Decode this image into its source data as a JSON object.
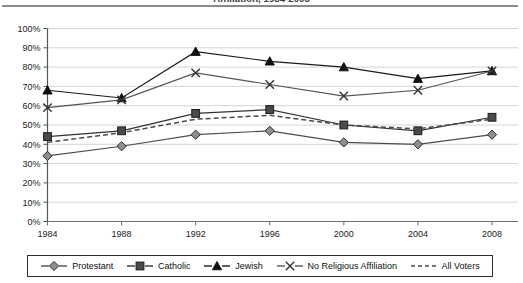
{
  "chart_data": {
    "type": "line",
    "title": "Affiliation, 1984-2008",
    "xlabel": "",
    "ylabel": "",
    "x": [
      1984,
      1988,
      1992,
      1996,
      2000,
      2004,
      2008
    ],
    "categories": [
      "1984",
      "1988",
      "1992",
      "1996",
      "2000",
      "2004",
      "2008"
    ],
    "ylim": [
      0,
      100
    ],
    "ytick_labels": [
      "0%",
      "10%",
      "20%",
      "30%",
      "40%",
      "50%",
      "60%",
      "70%",
      "80%",
      "90%",
      "100%"
    ],
    "ytick_values": [
      0,
      10,
      20,
      30,
      40,
      50,
      60,
      70,
      80,
      90,
      100
    ],
    "grid": "horizontal",
    "legend_position": "bottom",
    "series": [
      {
        "name": "Protestant",
        "marker": "diamond",
        "linestyle": "solid",
        "color": "#4d4d4d",
        "values": [
          34,
          39,
          45,
          47,
          41,
          40,
          45
        ]
      },
      {
        "name": "Catholic",
        "marker": "square",
        "linestyle": "solid",
        "color": "#333333",
        "values": [
          44,
          47,
          56,
          58,
          50,
          47,
          54
        ]
      },
      {
        "name": "Jewish",
        "marker": "triangle",
        "linestyle": "solid",
        "color": "#1a1a1a",
        "values": [
          68,
          64,
          88,
          83,
          80,
          74,
          78
        ]
      },
      {
        "name": "No Religious Affiliation",
        "marker": "x",
        "linestyle": "solid",
        "color": "#555555",
        "values": [
          59,
          63,
          77,
          71,
          65,
          68,
          78
        ]
      },
      {
        "name": "All Voters",
        "marker": "none",
        "linestyle": "dashed",
        "color": "#4a4a4a",
        "values": [
          41,
          46,
          53,
          55,
          50,
          48,
          53
        ]
      }
    ]
  },
  "legend": {
    "items": [
      {
        "label": "Protestant"
      },
      {
        "label": "Catholic"
      },
      {
        "label": "Jewish"
      },
      {
        "label": "No Religious Affiliation"
      },
      {
        "label": "All Voters"
      }
    ]
  }
}
